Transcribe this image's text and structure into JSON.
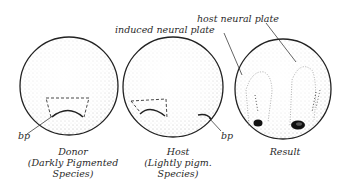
{
  "figure": {
    "type": "embryo transplantation diagram",
    "panels": [
      {
        "id": "donor",
        "caption_line1": "Donor",
        "caption_line2": "(Darkly Pigmented",
        "caption_line3": "Species)",
        "bp_label": "bp"
      },
      {
        "id": "host",
        "caption_line1": "Host",
        "caption_line2": "(Lightly pigm.",
        "caption_line3": "Species)",
        "bp_label": "bp"
      },
      {
        "id": "result",
        "caption_line1": "Result"
      }
    ],
    "annotations": {
      "induced_neural_plate": "induced neural plate",
      "host_neural_plate": "host neural plate"
    },
    "colors": {
      "ink": "#222222",
      "background": "#ffffff"
    }
  }
}
